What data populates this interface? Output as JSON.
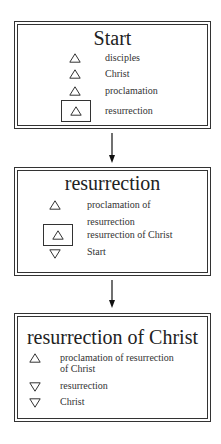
{
  "diagram": {
    "nodes": [
      {
        "title": "Start",
        "items": [
          {
            "direction": "up",
            "icon": "triangle-up-icon",
            "label": "disciples",
            "selected": false
          },
          {
            "direction": "up",
            "icon": "triangle-up-icon",
            "label": "Christ",
            "selected": false
          },
          {
            "direction": "up",
            "icon": "triangle-up-icon",
            "label": "proclamation",
            "selected": false
          },
          {
            "direction": "up",
            "icon": "triangle-up-icon",
            "label": "resurrection",
            "selected": true
          }
        ]
      },
      {
        "title": "resurrection",
        "items": [
          {
            "direction": "up",
            "icon": "triangle-up-icon",
            "label_line1": "proclamation of",
            "label_line2": "resurrection",
            "selected": false
          },
          {
            "direction": "up",
            "icon": "triangle-up-icon",
            "label": "resurrection of Christ",
            "selected": true
          },
          {
            "direction": "down",
            "icon": "triangle-down-icon",
            "label": "Start",
            "selected": false
          }
        ]
      },
      {
        "title": "resurrection of Christ",
        "items": [
          {
            "direction": "up",
            "icon": "triangle-up-icon",
            "label_line1": "proclamation of resurrection",
            "label_line2": "of Christ",
            "selected": false
          },
          {
            "direction": "down",
            "icon": "triangle-down-icon",
            "label": "resurrection",
            "selected": false
          },
          {
            "direction": "down",
            "icon": "triangle-down-icon",
            "label": "Christ",
            "selected": false
          }
        ]
      }
    ],
    "edges": [
      {
        "from": "Start",
        "to": "resurrection"
      },
      {
        "from": "resurrection",
        "to": "resurrection of Christ"
      }
    ]
  }
}
